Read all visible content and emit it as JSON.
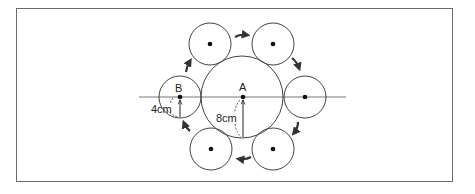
{
  "diagram": {
    "labels": {
      "center_big": "A",
      "center_small": "B",
      "radius_small": "4cm",
      "radius_big": "8cm"
    },
    "big_circle": {
      "label": "A",
      "radius_cm": 8
    },
    "small_circles": [
      {
        "position": "left",
        "label": "B",
        "radius_cm": 4
      },
      {
        "position": "top-left",
        "radius_cm": 4
      },
      {
        "position": "top-right",
        "radius_cm": 4
      },
      {
        "position": "right",
        "radius_cm": 4
      },
      {
        "position": "bottom-right",
        "radius_cm": 4
      },
      {
        "position": "bottom-left",
        "radius_cm": 4
      }
    ],
    "rotation_direction": "clockwise",
    "colors": {
      "stroke": "#333333",
      "line": "#777777",
      "frame": "#6a6a6a"
    }
  }
}
